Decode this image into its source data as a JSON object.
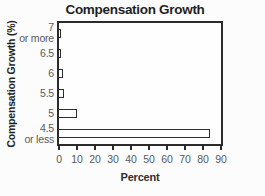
{
  "chart_data": {
    "type": "bar",
    "orientation": "horizontal",
    "title": "Compensation Growth",
    "xlabel": "Percent",
    "ylabel": "Compensation Growth (%)",
    "categories": [
      "7 or more",
      "6.5",
      "6",
      "5.5",
      "5",
      "4.5 or less"
    ],
    "category_lines": [
      [
        "7",
        "or more"
      ],
      [
        "6.5"
      ],
      [
        "6"
      ],
      [
        "5.5"
      ],
      [
        "5"
      ],
      [
        "4.5",
        "or less"
      ]
    ],
    "values": [
      1,
      0.5,
      2,
      2.5,
      10,
      84
    ],
    "xlim": [
      0,
      90
    ],
    "xticks": [
      0,
      10,
      20,
      30,
      40,
      50,
      60,
      70,
      80,
      90
    ],
    "grid": false,
    "legend": null,
    "colors": {
      "background": "#fcfcfc",
      "bar_fill": "#ffffff",
      "bar_border": "#2d2d2d",
      "frame": "#2b2b2b",
      "tick_text": "#595959",
      "title_text": "#1f1f1f"
    }
  }
}
